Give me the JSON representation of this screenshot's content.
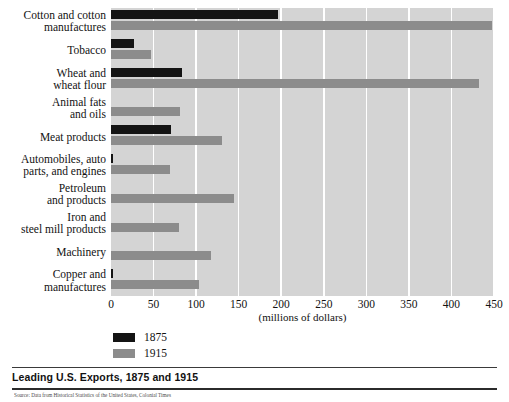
{
  "chart_data": {
    "type": "bar",
    "orientation": "horizontal",
    "title": "Leading U.S. Exports, 1875 and 1915",
    "xlabel": "(millions of dollars)",
    "ylabel": "",
    "xlim": [
      0,
      450
    ],
    "xticks": [
      0,
      50,
      100,
      150,
      200,
      250,
      300,
      350,
      400,
      450
    ],
    "grid": true,
    "legend_position": "below-axis-left",
    "categories": [
      "Cotton and cotton manufactures",
      "Tobacco",
      "Wheat and wheat flour",
      "Animal fats and oils",
      "Meat products",
      "Automobiles, auto parts, and engines",
      "Petroleum and products",
      "Iron and steel mill products",
      "Machinery",
      "Copper and manufactures"
    ],
    "series": [
      {
        "name": "1875",
        "color": "#141414",
        "values": [
          196,
          27,
          83,
          0,
          70,
          1,
          0,
          0,
          0,
          2
        ]
      },
      {
        "name": "1915",
        "color": "#8c8c8c",
        "values": [
          448,
          47,
          432,
          81,
          130,
          69,
          144,
          80,
          118,
          103
        ]
      }
    ]
  },
  "axis": {
    "unit_label": "(millions of dollars)",
    "tick_labels": [
      "0",
      "50",
      "100",
      "150",
      "200",
      "250",
      "300",
      "350",
      "400",
      "450"
    ]
  },
  "ylabels": [
    {
      "lines": [
        "Cotton and cotton",
        "manufactures"
      ]
    },
    {
      "lines": [
        "Tobacco"
      ]
    },
    {
      "lines": [
        "Wheat and",
        "wheat flour"
      ]
    },
    {
      "lines": [
        "Animal fats",
        "and oils"
      ]
    },
    {
      "lines": [
        "Meat products"
      ]
    },
    {
      "lines": [
        "Automobiles, auto",
        "parts, and engines"
      ]
    },
    {
      "lines": [
        "Petroleum",
        "and products"
      ]
    },
    {
      "lines": [
        "Iron and",
        "steel mill products"
      ]
    },
    {
      "lines": [
        "Machinery"
      ]
    },
    {
      "lines": [
        "Copper and",
        "manufactures"
      ]
    }
  ],
  "legend": {
    "items": [
      {
        "label": "1875",
        "color": "#141414"
      },
      {
        "label": "1915",
        "color": "#8c8c8c"
      }
    ]
  },
  "caption": {
    "text": "Leading U.S. Exports, 1875 and 1915"
  },
  "source": {
    "text": "Source: Data from Historical Statistics of the United States, Colonial Times"
  },
  "colors": {
    "plot_background": "#d4d4d4",
    "gridline": "#ffffff",
    "series_1875": "#141414",
    "series_1915": "#8c8c8c",
    "page_background": "#ffffff"
  }
}
